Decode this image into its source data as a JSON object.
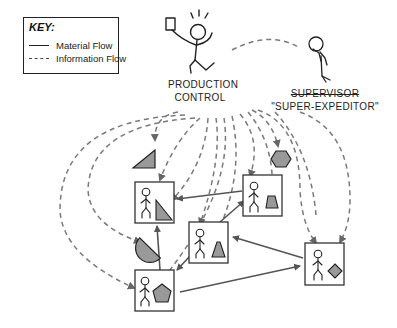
{
  "key": {
    "title": "KEY:",
    "items": [
      {
        "line": "solid",
        "label": "Material Flow"
      },
      {
        "line": "dashed",
        "label": "Information Flow"
      }
    ]
  },
  "actors": {
    "production_control": {
      "line1": "PRODUCTION",
      "line2": "CONTROL"
    },
    "supervisor": {
      "title_struck": "SUPERVISOR",
      "nickname": "\"SUPER-EXPEDITOR\""
    }
  },
  "workstations": [
    {
      "id": "ws-triangle",
      "part": "right-triangle"
    },
    {
      "id": "ws-trapezoid",
      "part": "trapezoid"
    },
    {
      "id": "ws-cone",
      "part": "cone"
    },
    {
      "id": "ws-diamond",
      "part": "diamond"
    },
    {
      "id": "ws-pentagon",
      "part": "pentagon"
    }
  ],
  "loose_parts": [
    "triangle",
    "hexagon",
    "half-disc"
  ],
  "colors": {
    "stroke": "#222222",
    "arrow": "#555555",
    "dashed": "#777777",
    "part_fill": "#999999"
  }
}
